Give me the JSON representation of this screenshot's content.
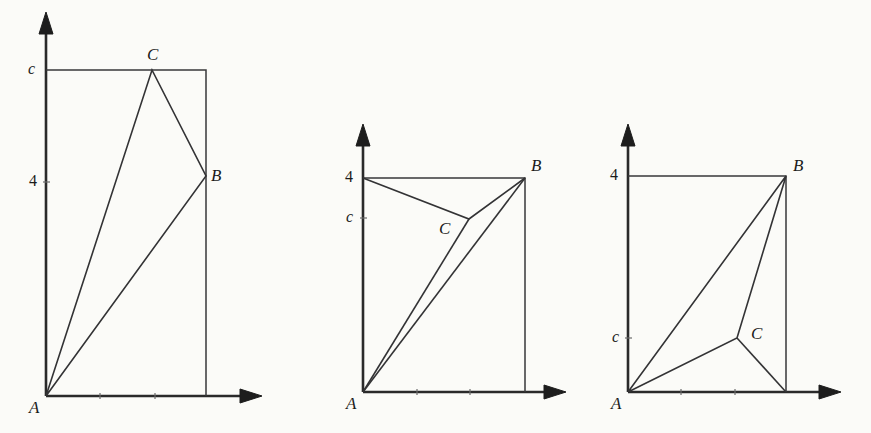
{
  "figure": {
    "background_color": "#fbfbf8",
    "line_color": "#333335",
    "axis_color": "#2a2a2a"
  },
  "panels": [
    {
      "id": "panel-left",
      "name": "left-figure",
      "axes": {
        "x_axis_name": "x-axis",
        "y_axis_name": "y-axis",
        "arrow_icon": "arrow-head-icon"
      },
      "y_ticks": [
        {
          "label": "c",
          "italic": true,
          "y_value": "c"
        },
        {
          "label": "4",
          "italic": false,
          "y_value": "4"
        }
      ],
      "points": [
        {
          "label": "A",
          "role": "origin-vertex"
        },
        {
          "label": "B",
          "role": "right-vertex"
        },
        {
          "label": "C",
          "role": "top-vertex"
        }
      ],
      "description": "C sits on the top edge at height c; B sits on the right edge at height 4; A is at the origin. Triangle A-C-B drawn."
    },
    {
      "id": "panel-middle",
      "name": "middle-figure",
      "axes": {
        "x_axis_name": "x-axis",
        "y_axis_name": "y-axis",
        "arrow_icon": "arrow-head-icon"
      },
      "y_ticks": [
        {
          "label": "4",
          "italic": false,
          "y_value": "4"
        },
        {
          "label": "c",
          "italic": true,
          "y_value": "c"
        }
      ],
      "points": [
        {
          "label": "A",
          "role": "origin-vertex"
        },
        {
          "label": "B",
          "role": "top-right-vertex"
        },
        {
          "label": "C",
          "role": "interior-vertex"
        }
      ],
      "description": "B is the top-right corner at height 4; C is an interior point just below height c; A is at the origin. Triangle A-C-B plus segment A-B drawn."
    },
    {
      "id": "panel-right",
      "name": "right-figure",
      "axes": {
        "x_axis_name": "x-axis",
        "y_axis_name": "y-axis",
        "arrow_icon": "arrow-head-icon"
      },
      "y_ticks": [
        {
          "label": "4",
          "italic": false,
          "y_value": "4"
        },
        {
          "label": "c",
          "italic": true,
          "y_value": "c"
        }
      ],
      "points": [
        {
          "label": "A",
          "role": "origin-vertex"
        },
        {
          "label": "B",
          "role": "top-right-vertex"
        },
        {
          "label": "C",
          "role": "interior-vertex"
        }
      ],
      "description": "B is the top-right corner at height 4; C is an interior point at about height c, lower-right area; A is at the origin. Triangle A-C-B plus segment C to bottom-right corner drawn."
    }
  ],
  "labels": {
    "left": {
      "tick_c": "c",
      "tick_4": "4",
      "point_A": "A",
      "point_B": "B",
      "point_C": "C"
    },
    "middle": {
      "tick_4": "4",
      "tick_c": "c",
      "point_A": "A",
      "point_B": "B",
      "point_C": "C"
    },
    "right": {
      "tick_4": "4",
      "tick_c": "c",
      "point_A": "A",
      "point_B": "B",
      "point_C": "C"
    }
  }
}
